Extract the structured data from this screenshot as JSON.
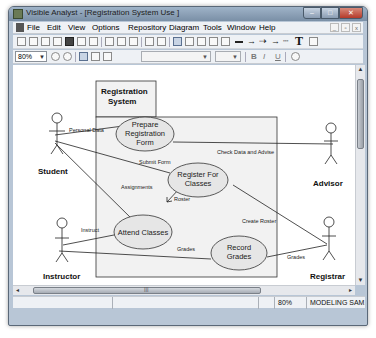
{
  "window": {
    "title": "Visible Analyst - [Registration System Use ]",
    "controls": {
      "minimize": "–",
      "maximize": "□",
      "close": "✕"
    }
  },
  "menubar": {
    "items": [
      "File",
      "Edit",
      "View",
      "Options",
      "Repository",
      "Diagram",
      "Tools",
      "Window",
      "Help"
    ],
    "mdi_controls": [
      "_",
      "▫",
      "x"
    ]
  },
  "toolbar2": {
    "zoom_value": "80%",
    "bold": "B",
    "italic": "I",
    "underline": "U"
  },
  "toolbar1": {
    "text_tool": "T"
  },
  "diagram": {
    "system_boundary": {
      "title_line1": "Registration",
      "title_line2": "System"
    },
    "actors": [
      {
        "name": "Student"
      },
      {
        "name": "Advisor"
      },
      {
        "name": "Instructor"
      },
      {
        "name": "Registrar"
      }
    ],
    "use_cases": [
      {
        "line1": "Prepare",
        "line2": "Registration",
        "line3": "Form"
      },
      {
        "line1": "Register For",
        "line2": "Classes"
      },
      {
        "line1": "Attend Classes"
      },
      {
        "line1": "Record",
        "line2": "Grades"
      }
    ],
    "associations": [
      {
        "label": "Personal Data"
      },
      {
        "label": "Check Data and Advise"
      },
      {
        "label": "Submit Form"
      },
      {
        "label": "Assignments"
      },
      {
        "label": "Roster"
      },
      {
        "label": "Instruct"
      },
      {
        "label": "Create Roster"
      },
      {
        "label": "Grades",
        "from": "Instructor"
      },
      {
        "label": "Grades",
        "from": "Registrar"
      }
    ]
  },
  "statusbar": {
    "zoom": "80%",
    "mode": "MODELING SAM..."
  },
  "colors": {
    "usecase_fill": "#e6e6e6",
    "boundary_fill": "#f2f2f2",
    "line": "#222222"
  }
}
